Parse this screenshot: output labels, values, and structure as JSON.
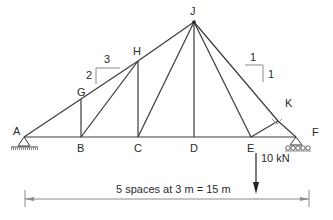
{
  "diagram": {
    "type": "truss",
    "joints": {
      "A": "A",
      "B": "B",
      "C": "C",
      "D": "D",
      "E": "E",
      "F": "F",
      "G": "G",
      "H": "H",
      "J": "J",
      "K": "K"
    },
    "members": [
      [
        "A",
        "G"
      ],
      [
        "G",
        "H"
      ],
      [
        "H",
        "J"
      ],
      [
        "J",
        "K"
      ],
      [
        "K",
        "F"
      ],
      [
        "A",
        "B"
      ],
      [
        "B",
        "C"
      ],
      [
        "C",
        "D"
      ],
      [
        "D",
        "E"
      ],
      [
        "E",
        "F"
      ],
      [
        "B",
        "G"
      ],
      [
        "B",
        "H"
      ],
      [
        "C",
        "H"
      ],
      [
        "C",
        "J"
      ],
      [
        "D",
        "J"
      ],
      [
        "E",
        "J"
      ],
      [
        "E",
        "K"
      ]
    ],
    "slope_left": {
      "run": "3",
      "rise": "2"
    },
    "slope_right": {
      "run": "1",
      "rise": "1"
    },
    "load": {
      "label": "10 kN",
      "joint": "E",
      "direction": "down"
    },
    "supports": {
      "A": "pin",
      "F": "roller"
    },
    "dimension": "5 spaces at 3 m = 15 m"
  }
}
